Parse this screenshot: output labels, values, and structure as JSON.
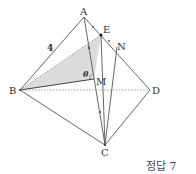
{
  "figure": {
    "type": "tetrahedron-geometry",
    "points": {
      "A": {
        "label": "A",
        "x": 84,
        "y": 17
      },
      "E": {
        "label": "E",
        "x": 101,
        "y": 35
      },
      "N": {
        "label": "N",
        "x": 117,
        "y": 47
      },
      "B": {
        "label": "B",
        "x": 20,
        "y": 90
      },
      "M": {
        "label": "M",
        "x": 94,
        "y": 79
      },
      "D": {
        "label": "D",
        "x": 150,
        "y": 90
      },
      "C": {
        "label": "C",
        "x": 105,
        "y": 145
      }
    },
    "edge_label": "4",
    "angle_label": "θ",
    "shaded_region": "triangle BEM",
    "colors": {
      "line": "#555555",
      "shade": "#d8d8d8",
      "dashed": "#888888"
    }
  },
  "answer": {
    "text": "정답 7"
  }
}
